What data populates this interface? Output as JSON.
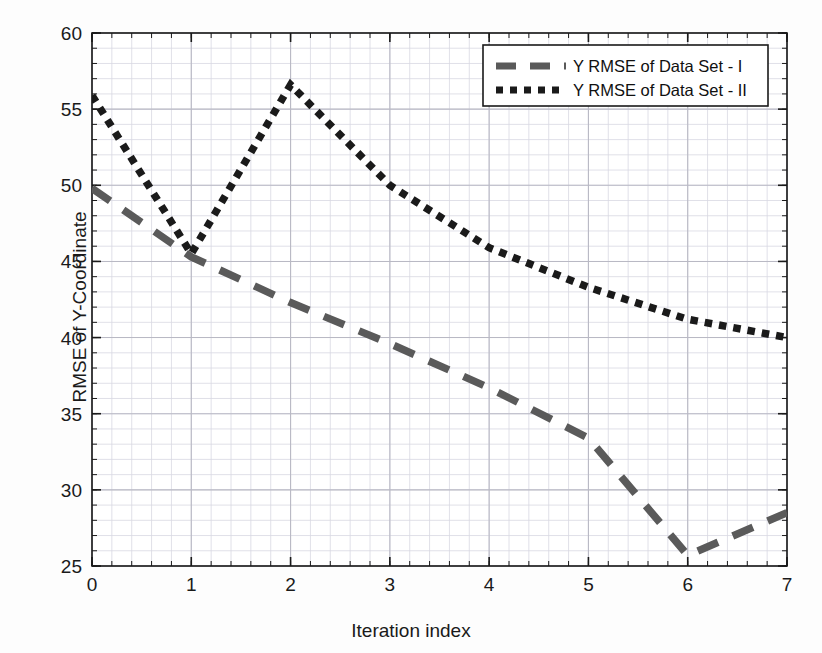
{
  "chart_data": {
    "type": "line",
    "title": "",
    "xlabel": "Iteration index",
    "ylabel": "RMSE of Y-Coordinate",
    "xlim": [
      0,
      7
    ],
    "ylim": [
      25,
      60
    ],
    "xticks": [
      "0",
      "1",
      "2",
      "3",
      "4",
      "5",
      "6",
      "7"
    ],
    "yticks": [
      "25",
      "30",
      "35",
      "40",
      "45",
      "50",
      "55",
      "60"
    ],
    "x": [
      0,
      1,
      2,
      3,
      4,
      5,
      6,
      7
    ],
    "grid": true,
    "minor_grid": true,
    "legend_position": "top-right",
    "series": [
      {
        "name": "Y RMSE of Data Set - I",
        "style": "dashed",
        "color": "#5a5a5a",
        "values": [
          49.8,
          45.3,
          42.3,
          39.6,
          36.7,
          33.4,
          25.7,
          28.5
        ]
      },
      {
        "name": "Y RMSE of Data Set - II",
        "style": "dotted",
        "color": "#1a1a1a",
        "values": [
          55.9,
          45.5,
          56.6,
          50.0,
          45.9,
          43.3,
          41.2,
          40.0
        ]
      }
    ]
  },
  "axes": {
    "x_label": "Iteration index",
    "y_label": "RMSE of Y-Coordinate"
  },
  "legend": {
    "entries": [
      {
        "label": "Y RMSE of Data Set - I",
        "style": "dashed"
      },
      {
        "label": "Y RMSE of Data Set - II",
        "style": "dotted"
      }
    ]
  },
  "colors": {
    "series_1": "#5a5a5a",
    "series_2": "#1a1a1a",
    "grid_major": "#b9b9c4",
    "grid_minor": "#d8d8e2",
    "axis": "#1a1a1a",
    "background": "#fdfdfd"
  }
}
